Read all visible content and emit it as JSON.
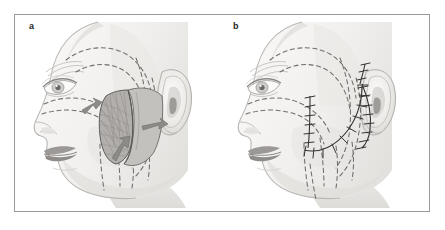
{
  "figure": {
    "type": "medical-illustration",
    "panel_count": 2,
    "border_color": "#9a9a9a",
    "background": "#ffffff"
  },
  "panels": [
    {
      "id": "a",
      "label": "a",
      "caption_text": "a",
      "description": "Profile view with dashed markings showing planned dissection planes; SMAS flap elevated and retracted with directional arrows indicating vector of pull",
      "features": {
        "dashed_planning_lines": true,
        "flap_elevated": true,
        "arrows": 3,
        "sutures": false
      }
    },
    {
      "id": "b",
      "label": "b",
      "caption_text": "b",
      "description": "Same profile view after SMAS flap repositioning, showing completed suture lines with interrupted stitches along the preauricular and cheek closure",
      "features": {
        "dashed_planning_lines": true,
        "flap_elevated": false,
        "arrows": 0,
        "sutures": true,
        "suture_lines": 2
      }
    }
  ],
  "colors": {
    "skin_light": "#f4f2f0",
    "skin_shadow": "#e3e1df",
    "skin_mid": "#ebe9e6",
    "hair_dark": "#8f8f8f",
    "hair_mid": "#a8a8a8",
    "hair_light": "#cfcfcf",
    "flap_fill": "#b9b7b4",
    "flap_fibrous": "#a9a6a2",
    "arrow_gray": "#8d8b88",
    "lip_gray": "#939090",
    "dashed_line": "#6f6d6b",
    "suture_line": "#3a3a3a",
    "outline": "#7d7b79",
    "border": "#9a9a9a"
  }
}
